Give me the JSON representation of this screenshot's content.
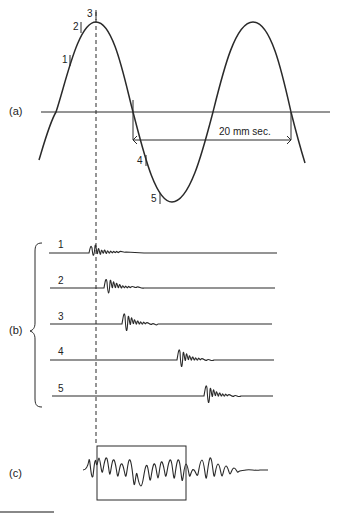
{
  "panels": {
    "a": {
      "label": "(a)",
      "points": [
        {
          "id": "1",
          "label": "1"
        },
        {
          "id": "2",
          "label": "2"
        },
        {
          "id": "3",
          "label": "3"
        },
        {
          "id": "4",
          "label": "4"
        },
        {
          "id": "5",
          "label": "5"
        }
      ],
      "period_annotation": "20 mm sec."
    },
    "b": {
      "label": "(b)",
      "traces": [
        {
          "label": "1"
        },
        {
          "label": "2"
        },
        {
          "label": "3"
        },
        {
          "label": "4"
        },
        {
          "label": "5"
        }
      ]
    },
    "c": {
      "label": "(c)"
    }
  },
  "colors": {
    "stroke": "#2a2a2a",
    "background": "#ffffff"
  }
}
